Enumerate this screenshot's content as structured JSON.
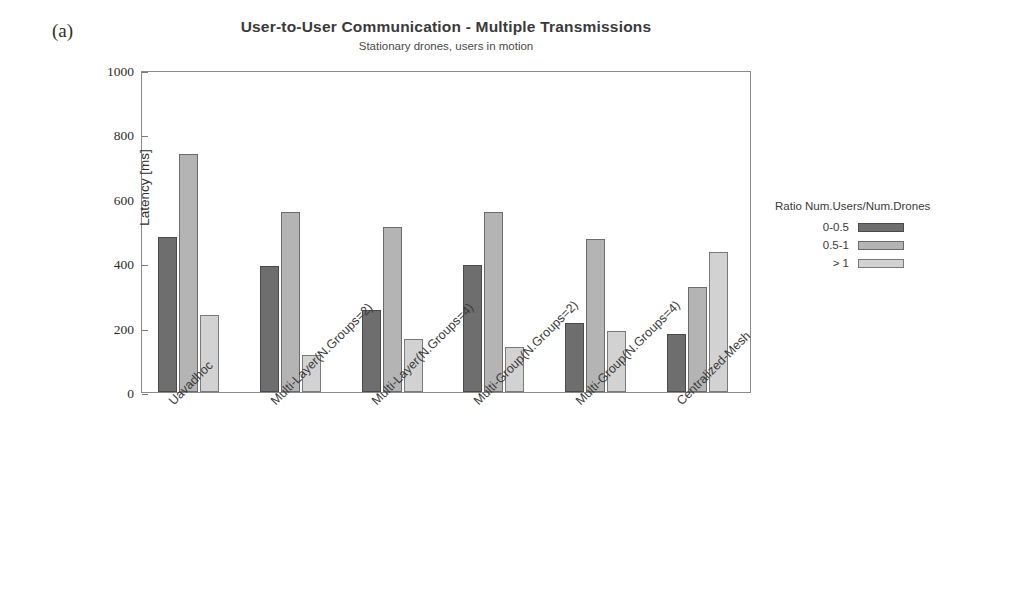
{
  "panel_label": "(a)",
  "chart_data": {
    "type": "bar",
    "title": "User-to-User Communication - Multiple Transmissions",
    "subtitle": "Stationary drones, users in motion",
    "xlabel": "",
    "ylabel": "Latency [ms]",
    "ylim": [
      0,
      1000
    ],
    "yticks": [
      0,
      200,
      400,
      600,
      800,
      1000
    ],
    "ytick_labels": [
      "0",
      "200",
      "400",
      "600",
      "800",
      "1000"
    ],
    "grid": false,
    "legend_position": "right",
    "legend_title": "Ratio Num.Users/Num.Drones",
    "categories": [
      "Uavadhoc",
      "Multi-Layer(N.Groups=2)",
      "Multi-Layer(N.Groups=4)",
      "Multi-Group(N.Groups=2)",
      "Multi-Group(N.Groups=4)",
      "Centralized-Mesh"
    ],
    "series": [
      {
        "name": "0-0.5",
        "color": "#6e6e6e",
        "values": [
          480,
          390,
          255,
          395,
          215,
          180
        ]
      },
      {
        "name": "0.5-1",
        "color": "#b4b4b4",
        "values": [
          740,
          560,
          512,
          560,
          475,
          325
        ]
      },
      {
        "name": "> 1",
        "color": "#d2d2d2",
        "values": [
          240,
          115,
          165,
          140,
          190,
          435
        ]
      }
    ]
  }
}
